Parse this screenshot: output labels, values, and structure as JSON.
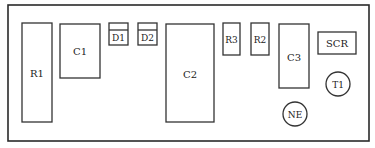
{
  "diagram": {
    "title": "",
    "board_label": "circuit board component layout",
    "components": {
      "R1": {
        "label": "R1",
        "shape": "rectangle"
      },
      "C1": {
        "label": "C1",
        "shape": "rectangle"
      },
      "D1": {
        "label": "D1",
        "shape": "diode-box"
      },
      "D2": {
        "label": "D2",
        "shape": "diode-box"
      },
      "C2": {
        "label": "C2",
        "shape": "rectangle"
      },
      "R3": {
        "label": "R3",
        "shape": "rectangle"
      },
      "R2": {
        "label": "R2",
        "shape": "rectangle"
      },
      "C3": {
        "label": "C3",
        "shape": "rectangle"
      },
      "SCR": {
        "label": "SCR",
        "shape": "rectangle"
      },
      "T1": {
        "label": "T1",
        "shape": "circle"
      },
      "NE": {
        "label": "NE",
        "shape": "circle"
      }
    },
    "colors": {
      "line": "#333333",
      "text": "#222222",
      "background": "#ffffff"
    }
  }
}
